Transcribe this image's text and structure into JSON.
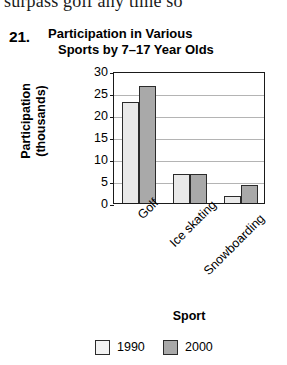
{
  "page": {
    "clipped_top_text": "surpass golf any time so",
    "background_color": "#ffffff"
  },
  "problem": {
    "number": "21.",
    "title_line1": "Participation in Various",
    "title_line2": "Sports by 7–17 Year Olds"
  },
  "chart_data": {
    "type": "bar",
    "title": "Participation in Various Sports by 7–17 Year Olds",
    "subtitle": "",
    "xlabel": "Sport",
    "ylabel": "Participation (thousands)",
    "categories": [
      "Golf",
      "Ice skating",
      "Snowboarding"
    ],
    "series": [
      {
        "name": "1990",
        "color": "#e9e9e9",
        "values": [
          23,
          6.5,
          1.5
        ]
      },
      {
        "name": "2000",
        "color": "#a9a9a9",
        "values": [
          26.5,
          6.7,
          4
        ]
      }
    ],
    "ylim": [
      0,
      30
    ],
    "yticks": [
      30,
      25,
      20,
      15,
      10,
      5,
      0
    ],
    "ytick_labels": [
      "30",
      "25",
      "20",
      "15",
      "10",
      "5",
      "0"
    ],
    "grid": true,
    "grid_axis": "y",
    "legend_position": "bottom",
    "legend_entries": [
      "1990",
      "2000"
    ],
    "annotations": [],
    "bar_edge_color": "#2b2b2b",
    "frame": true
  }
}
